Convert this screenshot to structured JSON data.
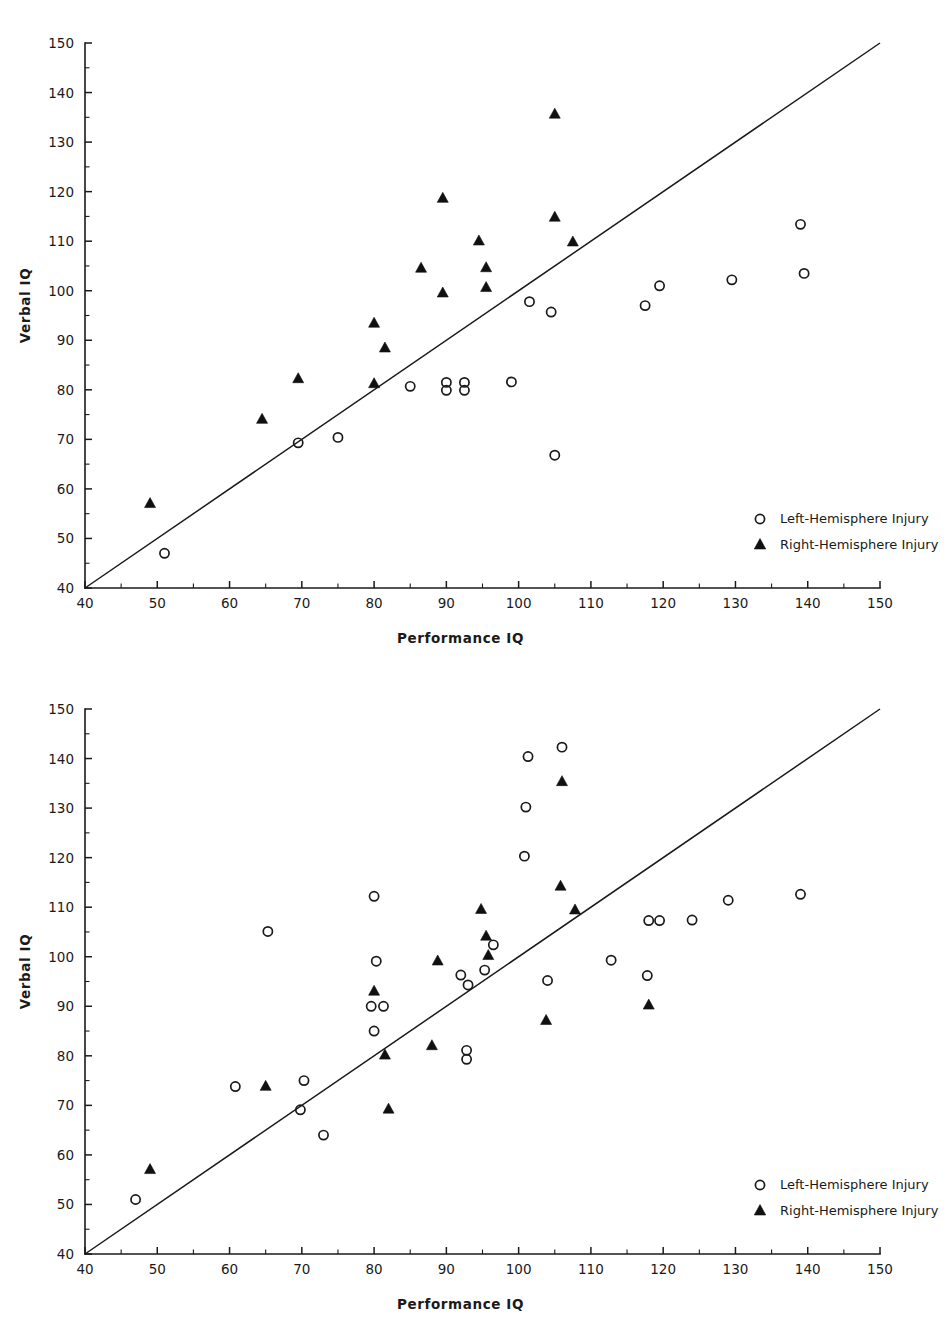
{
  "figure": {
    "background_color": "#ffffff",
    "ink_color": "#1a1a1a",
    "panel_count": 2
  },
  "axis": {
    "x_title": "Performance  IQ",
    "y_title": "Verbal  IQ",
    "x_ticks": [
      "40",
      "50",
      "60",
      "70",
      "80",
      "90",
      "100",
      "110",
      "120",
      "130",
      "140",
      "150"
    ],
    "y_ticks": [
      "40",
      "50",
      "60",
      "70",
      "80",
      "90",
      "100",
      "110",
      "120",
      "130",
      "140",
      "150"
    ],
    "x_min": 40,
    "x_max": 150,
    "y_min": 40,
    "y_max": 150,
    "minor_tick_step": 5
  },
  "legend": {
    "position": "bottom-right",
    "entries": [
      {
        "marker": "open-circle-marker",
        "label": "Left-Hemisphere Injury"
      },
      {
        "marker": "filled-triangle-marker",
        "label": "Right-Hemisphere Injury"
      }
    ]
  },
  "chart_data": [
    {
      "type": "scatter",
      "panel": "top",
      "title": "",
      "xlabel": "Performance  IQ",
      "ylabel": "Verbal  IQ",
      "xlim": [
        40,
        150
      ],
      "ylim": [
        40,
        150
      ],
      "grid": false,
      "reference_line": {
        "kind": "identity",
        "from": [
          40,
          40
        ],
        "to": [
          150,
          150
        ]
      },
      "legend_position": "bottom-right",
      "series": [
        {
          "name": "Left-Hemisphere Injury",
          "marker": "open-circle",
          "points": [
            [
              51.0,
              47.0
            ],
            [
              69.5,
              69.3
            ],
            [
              75.0,
              70.4
            ],
            [
              85.0,
              80.7
            ],
            [
              90.0,
              81.5
            ],
            [
              90.0,
              79.9
            ],
            [
              92.5,
              81.5
            ],
            [
              92.5,
              79.9
            ],
            [
              99.0,
              81.6
            ],
            [
              101.5,
              97.8
            ],
            [
              104.5,
              95.7
            ],
            [
              105.0,
              66.8
            ],
            [
              117.5,
              97.0
            ],
            [
              119.5,
              101.0
            ],
            [
              129.5,
              102.2
            ],
            [
              139.0,
              113.4
            ],
            [
              139.5,
              103.5
            ]
          ]
        },
        {
          "name": "Right-Hemisphere Injury",
          "marker": "filled-triangle",
          "points": [
            [
              49.0,
              57.0
            ],
            [
              64.5,
              74.0
            ],
            [
              69.5,
              82.2
            ],
            [
              80.0,
              93.4
            ],
            [
              80.0,
              81.2
            ],
            [
              81.5,
              88.4
            ],
            [
              86.5,
              104.5
            ],
            [
              89.5,
              99.5
            ],
            [
              89.5,
              118.6
            ],
            [
              94.5,
              110.0
            ],
            [
              95.5,
              104.6
            ],
            [
              95.5,
              100.6
            ],
            [
              105.0,
              135.6
            ],
            [
              105.0,
              114.8
            ],
            [
              107.5,
              109.8
            ]
          ]
        }
      ]
    },
    {
      "type": "scatter",
      "panel": "bottom",
      "title": "",
      "xlabel": "Performance  IQ",
      "ylabel": "Verbal  IQ",
      "xlim": [
        40,
        150
      ],
      "ylim": [
        40,
        150
      ],
      "grid": false,
      "reference_line": {
        "kind": "identity",
        "from": [
          40,
          40
        ],
        "to": [
          150,
          150
        ]
      },
      "legend_position": "bottom-right",
      "series": [
        {
          "name": "Left-Hemisphere Injury",
          "marker": "open-circle",
          "points": [
            [
              47.0,
              51.0
            ],
            [
              60.8,
              73.8
            ],
            [
              65.3,
              105.1
            ],
            [
              69.8,
              69.1
            ],
            [
              70.3,
              75.0
            ],
            [
              73.0,
              64.0
            ],
            [
              80.0,
              112.2
            ],
            [
              80.3,
              99.1
            ],
            [
              79.6,
              90.0
            ],
            [
              81.3,
              90.0
            ],
            [
              80.0,
              85.0
            ],
            [
              92.0,
              96.3
            ],
            [
              93.0,
              94.3
            ],
            [
              95.3,
              97.3
            ],
            [
              92.8,
              81.1
            ],
            [
              92.8,
              79.3
            ],
            [
              96.5,
              102.4
            ],
            [
              101.3,
              140.4
            ],
            [
              101.0,
              130.2
            ],
            [
              100.8,
              120.3
            ],
            [
              104.0,
              95.2
            ],
            [
              106.0,
              142.3
            ],
            [
              112.8,
              99.3
            ],
            [
              117.8,
              96.2
            ],
            [
              119.5,
              107.3
            ],
            [
              118.0,
              107.3
            ],
            [
              124.0,
              107.4
            ],
            [
              129.0,
              111.4
            ],
            [
              139.0,
              112.6
            ]
          ]
        },
        {
          "name": "Right-Hemisphere Injury",
          "marker": "filled-triangle",
          "points": [
            [
              49.0,
              57.0
            ],
            [
              65.0,
              73.8
            ],
            [
              80.0,
              93.0
            ],
            [
              81.5,
              80.1
            ],
            [
              82.0,
              69.2
            ],
            [
              88.0,
              82.0
            ],
            [
              88.8,
              99.1
            ],
            [
              94.8,
              109.5
            ],
            [
              95.5,
              104.1
            ],
            [
              95.8,
              100.2
            ],
            [
              103.8,
              87.1
            ],
            [
              105.8,
              114.2
            ],
            [
              106.0,
              135.3
            ],
            [
              107.8,
              109.4
            ],
            [
              118.0,
              90.2
            ]
          ]
        }
      ]
    }
  ]
}
